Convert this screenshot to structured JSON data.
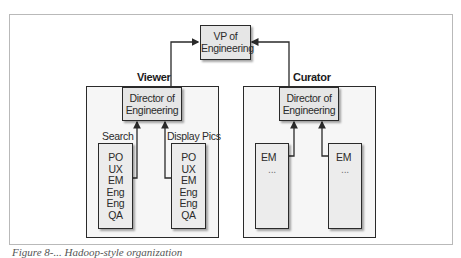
{
  "diagram": {
    "top": {
      "label_line1": "VP of",
      "label_line2": "Engineering"
    },
    "groups": [
      {
        "name": "Viewer",
        "director": {
          "label_line1": "Director of",
          "label_line2": "Engineering"
        },
        "teams": [
          {
            "name": "Search",
            "members": [
              "PO",
              "UX",
              "EM",
              "Eng",
              "Eng",
              "QA"
            ]
          },
          {
            "name": "Display Pics",
            "members": [
              "PO",
              "UX",
              "EM",
              "Eng",
              "Eng",
              "QA"
            ]
          }
        ]
      },
      {
        "name": "Curator",
        "director": {
          "label_line1": "Director of",
          "label_line2": "Engineering"
        },
        "teams": [
          {
            "name": "",
            "members": [
              "EM",
              "..."
            ]
          },
          {
            "name": "",
            "members": [
              "EM",
              "..."
            ]
          }
        ]
      }
    ],
    "caption": "Figure 8-... Hadoop-style organization"
  },
  "colors": {
    "line": "#2a2a2a",
    "box_fill": "#e6e6e6",
    "group_fill": "#f6f6f6",
    "frame": "#b9b9b9"
  }
}
